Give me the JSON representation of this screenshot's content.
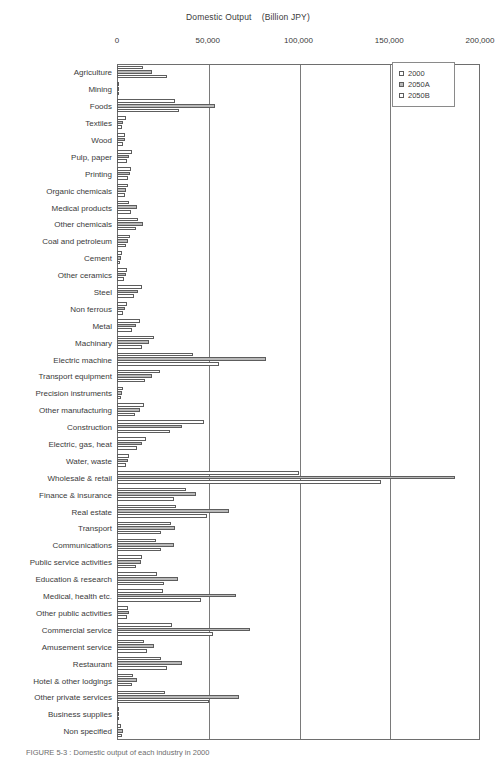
{
  "chart_data": {
    "type": "bar",
    "orientation": "horizontal",
    "title": "Domestic Output    (Billion JPY)",
    "xlabel": "",
    "ylabel": "",
    "xlim": [
      0,
      200000
    ],
    "xticks": [
      0,
      50000,
      100000,
      150000,
      200000
    ],
    "xtick_labels": [
      "0",
      "50,000",
      "100,000",
      "150,000",
      "200,000"
    ],
    "grid": true,
    "grid_axis": "x",
    "legend": {
      "position": "top-right",
      "entries": [
        {
          "name": "2000",
          "swatch": "white"
        },
        {
          "name": "2050A",
          "swatch": "gray"
        },
        {
          "name": "2050B",
          "swatch": "white"
        }
      ]
    },
    "categories": [
      "Agriculture",
      "Mining",
      "Foods",
      "Textiles",
      "Wood",
      "Pulp, paper",
      "Printing",
      "Organic chemicals",
      "Medical products",
      "Other chemicals",
      "Coal and petroleum",
      "Cement",
      "Other ceramics",
      "Steel",
      "Non ferrous",
      "Metal",
      "Machinary",
      "Electric machine",
      "Transport equipment",
      "Precision instruments",
      "Other manufacturing",
      "Construction",
      "Electric, gas, heat",
      "Water, waste",
      "Wholesale & retail",
      "Finance & insurance",
      "Real estate",
      "Transport",
      "Communications",
      "Public service activities",
      "Education & research",
      "Medical, health etc.",
      "Other public activities",
      "Commercial service",
      "Amusement service",
      "Restaurant",
      "Hotel & other lodgings",
      "Other private services",
      "Business supplies",
      "Non specified"
    ],
    "series": [
      {
        "name": "2000",
        "swatch": "white",
        "values": [
          14500,
          1200,
          32000,
          5200,
          4200,
          8500,
          7600,
          5800,
          6600,
          11500,
          7200,
          2600,
          5400,
          13800,
          5300,
          12600,
          20200,
          42000,
          23800,
          3400,
          14800,
          47800,
          15900,
          6400,
          100000,
          38000,
          32500,
          29500,
          21500,
          13500,
          21800,
          25600,
          6200,
          30500,
          14800,
          24500,
          8800,
          26500,
          900,
          2100
        ]
      },
      {
        "name": "2050A",
        "swatch": "gray",
        "values": [
          19200,
          1000,
          54000,
          3500,
          4600,
          6800,
          7000,
          5200,
          10800,
          14100,
          6000,
          2100,
          4800,
          11400,
          4400,
          10600,
          17600,
          82000,
          19400,
          2900,
          12500,
          36000,
          13800,
          5900,
          186000,
          43500,
          61500,
          32000,
          31200,
          13000,
          33500,
          65500,
          6700,
          73500,
          20600,
          35800,
          11000,
          67000,
          1200,
          3100
        ]
      },
      {
        "name": "2050B",
        "swatch": "white",
        "values": [
          27500,
          800,
          34000,
          2700,
          3300,
          5600,
          5800,
          4200,
          7800,
          10200,
          4700,
          1700,
          3900,
          9200,
          3500,
          8400,
          14000,
          56000,
          15400,
          2300,
          10000,
          29200,
          11200,
          4800,
          145500,
          31500,
          49500,
          24500,
          24000,
          10200,
          26000,
          46500,
          5300,
          53000,
          16400,
          27800,
          8500,
          50500,
          950,
          2500
        ]
      }
    ]
  },
  "caption": {
    "text": "FIGURE 5-3 :  Domestic output of each industry in 2000"
  }
}
